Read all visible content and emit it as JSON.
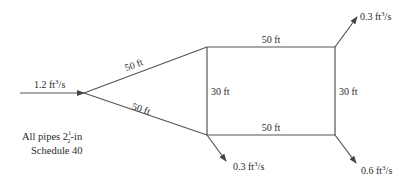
{
  "diagram": {
    "type": "pipe-network",
    "inflow": {
      "value": "1.2",
      "unit": "ft",
      "exp": "3",
      "per": "/s"
    },
    "outflows": [
      {
        "id": "top-right",
        "value": "0.3",
        "unit": "ft",
        "exp": "3",
        "per": "/s"
      },
      {
        "id": "bottom-left",
        "value": "0.3",
        "unit": "ft",
        "exp": "3",
        "per": "/s"
      },
      {
        "id": "bottom-right",
        "value": "0.6",
        "unit": "ft",
        "exp": "3",
        "per": "/s"
      }
    ],
    "pipe_lengths": {
      "upper_diagonal": "50 ft",
      "lower_diagonal": "50 ft",
      "top": "50 ft",
      "bottom": "50 ft",
      "left_vertical": "30 ft",
      "right_vertical": "30 ft"
    },
    "note": {
      "line1_prefix": "All pipes 2",
      "frac_num": "1",
      "frac_den": "2",
      "line1_suffix": "-in",
      "line2": "Schedule 40"
    },
    "colors": {
      "line": "#555555",
      "text": "#2a2a2a",
      "background": "#ffffff"
    }
  }
}
